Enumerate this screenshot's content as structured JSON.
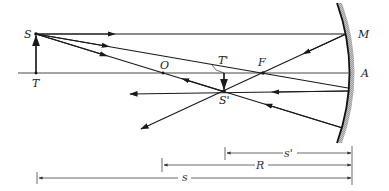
{
  "diagram": {
    "type": "concave-mirror-ray-diagram",
    "labels": {
      "object_top": "S",
      "object_base": "T",
      "image_top": "S'",
      "image_base": "T'",
      "center_of_curvature": "O",
      "focal_point": "F",
      "mirror_point": "M",
      "mirror_vertex": "A"
    },
    "dimensions": {
      "image_distance": "s'",
      "radius": "R",
      "object_distance": "s"
    },
    "colors": {
      "ink": "#1a1a1a",
      "mirror_hatch": "#9a9a9a",
      "background": "#ffffff"
    }
  }
}
